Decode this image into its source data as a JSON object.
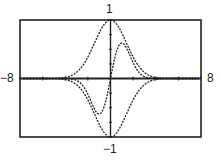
{
  "chart_data": {
    "type": "line",
    "title": "",
    "xlabel": "",
    "ylabel": "",
    "xlim": [
      -8,
      8
    ],
    "ylim": [
      -1,
      1
    ],
    "x_tick_spacing": 2,
    "y_tick_spacing": 0.25,
    "window_labels": {
      "xmin": "−8",
      "xmax": "8",
      "ymin": "−1",
      "ymax": "1"
    },
    "series": [
      {
        "name": "upper envelope",
        "formula": "exp(-x^2/4)",
        "style": "dotted"
      },
      {
        "name": "lower envelope",
        "formula": "-exp(-x^2/4)",
        "style": "dotted"
      },
      {
        "name": "damped curve",
        "formula": "x*exp(-x^2/2)",
        "style": "dotted",
        "peak": [
          1,
          0.6
        ],
        "trough": [
          -1,
          -0.6
        ]
      }
    ],
    "grid": false,
    "legend": "none"
  }
}
